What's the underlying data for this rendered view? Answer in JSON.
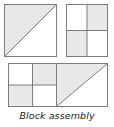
{
  "figure": {
    "caption": "Block assembly",
    "colors": {
      "background": "#ffffff",
      "patch_shaded": "#e8e8e8",
      "patch_plain": "#ffffff",
      "outline": "#7d7d7d",
      "caption_text": "#1a1a1a"
    },
    "blocks": [
      {
        "id": "half-square-triangle-block",
        "name": "Half square triangle block",
        "type": "half-square-triangle",
        "position": {
          "x": 4,
          "y": 4,
          "width": 53,
          "height": 53
        },
        "diagonal": "bottom-left-to-top-right",
        "patches": [
          {
            "region": "upper-left-triangle",
            "fill": "#e8e8e8"
          },
          {
            "region": "lower-right-triangle",
            "fill": "#ffffff"
          }
        ]
      },
      {
        "id": "four-patch-block",
        "name": "Four patch checkerboard block",
        "type": "four-patch",
        "position": {
          "x": 66,
          "y": 4,
          "width": 42,
          "height": 53
        },
        "rows": 2,
        "columns": 2,
        "patches": [
          {
            "region": "top-left",
            "fill": "#ffffff"
          },
          {
            "region": "top-right",
            "fill": "#e8e8e8"
          },
          {
            "region": "bottom-left",
            "fill": "#e8e8e8"
          },
          {
            "region": "bottom-right",
            "fill": "#ffffff"
          }
        ]
      },
      {
        "id": "assembled-block",
        "name": "Assembled block rectangle",
        "type": "assembly",
        "position": {
          "x": 8,
          "y": 63,
          "width": 100,
          "height": 44
        },
        "sections": [
          {
            "id": "assembly-four-patch-half",
            "name": "Four patch half",
            "type": "four-patch",
            "patches": [
              {
                "region": "top-left",
                "fill": "#ffffff"
              },
              {
                "region": "top-right",
                "fill": "#e8e8e8"
              },
              {
                "region": "bottom-left",
                "fill": "#e8e8e8"
              },
              {
                "region": "bottom-right",
                "fill": "#ffffff"
              }
            ]
          },
          {
            "id": "assembly-triangle-half",
            "name": "Half square triangle half",
            "type": "half-square-triangle",
            "diagonal": "bottom-left-to-top-right",
            "patches": [
              {
                "region": "upper-left-triangle",
                "fill": "#e8e8e8"
              },
              {
                "region": "lower-right-triangle",
                "fill": "#ffffff"
              }
            ]
          }
        ]
      }
    ]
  }
}
